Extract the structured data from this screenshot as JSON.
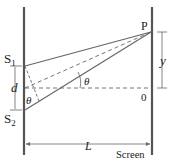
{
  "labels": {
    "S1_main": "S",
    "S1_sub": "1",
    "S2_main": "S",
    "S2_sub": "2",
    "P": "P",
    "y": "y",
    "d": "d",
    "theta_center": "θ",
    "theta_slit": "θ",
    "origin": "0",
    "L": "L",
    "screen": "Screen"
  },
  "colors": {
    "line": "#555555",
    "wall": "#444444"
  }
}
